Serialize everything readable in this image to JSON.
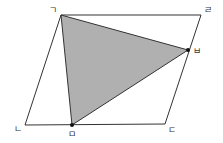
{
  "diagram": {
    "title": "",
    "shape": "parallelogram",
    "vertices": [
      {
        "id": "g",
        "label": "ㄱ"
      },
      {
        "id": "l",
        "label": "ㄹ"
      },
      {
        "id": "d",
        "label": "ㄷ"
      },
      {
        "id": "n",
        "label": "ㄴ"
      }
    ],
    "points": [
      {
        "id": "b",
        "label": "ㅂ",
        "on_segment": "ㄹㄷ"
      },
      {
        "id": "m",
        "label": "ㅁ",
        "on_segment": "ㄴㄷ"
      }
    ],
    "shaded_triangle": [
      "ㄱ",
      "ㅂ",
      "ㅁ"
    ],
    "colors": {
      "shade": "#b0b0b0",
      "line": "#333333"
    }
  }
}
